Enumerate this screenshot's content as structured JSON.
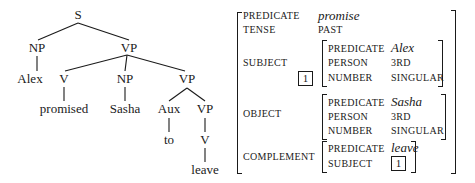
{
  "tree": {
    "nodes": {
      "s": "S",
      "np_subj": "NP",
      "vp_main": "VP",
      "alex": "Alex",
      "v_main": "V",
      "np_obj": "NP",
      "vp_comp": "VP",
      "promised": "promised",
      "sasha": "Sasha",
      "aux": "Aux",
      "vp_inner": "VP",
      "to": "to",
      "v_inner": "V",
      "leave": "leave"
    }
  },
  "avm": {
    "predicate": {
      "label": "PREDICATE",
      "value": "promise"
    },
    "tense": {
      "label": "TENSE",
      "value": "PAST"
    },
    "subject": {
      "label": "SUBJECT",
      "tag": "1",
      "predicate": {
        "label": "PREDICATE",
        "value": "Alex"
      },
      "person": {
        "label": "PERSON",
        "value": "3RD"
      },
      "number": {
        "label": "NUMBER",
        "value": "SINGULAR"
      }
    },
    "object": {
      "label": "OBJECT",
      "predicate": {
        "label": "PREDICATE",
        "value": "Sasha"
      },
      "person": {
        "label": "PERSON",
        "value": "3RD"
      },
      "number": {
        "label": "NUMBER",
        "value": "SINGULAR"
      }
    },
    "complement": {
      "label": "COMPLEMENT",
      "predicate": {
        "label": "PREDICATE",
        "value": "leave"
      },
      "subject": {
        "label": "SUBJECT",
        "tag": "1"
      }
    }
  }
}
